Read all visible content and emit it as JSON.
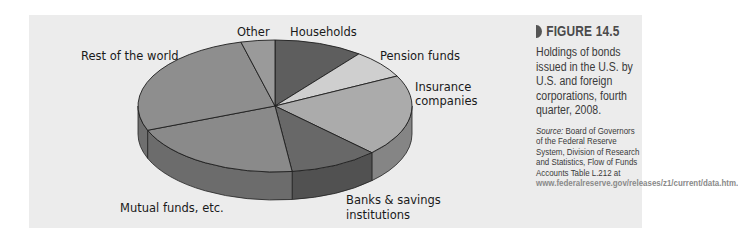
{
  "figure": {
    "number": "FIGURE 14.5",
    "description": "Holdings of bonds issued in the U.S. by U.S. and foreign corporations, fourth quarter, 2008.",
    "source_label": "Source:",
    "source_text": "Board of Governors of the Federal Reserve System, Division of Research and Statistics, Flow of Funds Accounts Table L.212 at",
    "source_url": "www.federalreserve.gov/releases/z1/current/data.htm."
  },
  "labels": {
    "households": "Households",
    "pension": "Pension funds",
    "insurance_1": "Insurance",
    "insurance_2": "companies",
    "banks_1": "Banks & savings",
    "banks_2": "institutions",
    "mutual": "Mutual funds, etc.",
    "rest": "Rest of the world",
    "other": "Other"
  },
  "chart_data": {
    "type": "pie",
    "style": "3d",
    "title": "Holdings of bonds issued in the U.S. by U.S. and foreign corporations, fourth quarter, 2008",
    "categories": [
      "Households",
      "Pension funds",
      "Insurance companies",
      "Banks & savings institutions",
      "Mutual funds, etc.",
      "Rest of the world",
      "Other"
    ],
    "values": [
      10.5,
      7,
      20,
      10.5,
      21,
      27,
      4
    ],
    "unit": "percent (estimated from slice angles)",
    "colors": [
      "#5e5e5e",
      "#cfcfcf",
      "#ababab",
      "#686868",
      "#8a8a8a",
      "#8e8e8e",
      "#9a9a9a"
    ],
    "legend": "none (direct labels)"
  }
}
